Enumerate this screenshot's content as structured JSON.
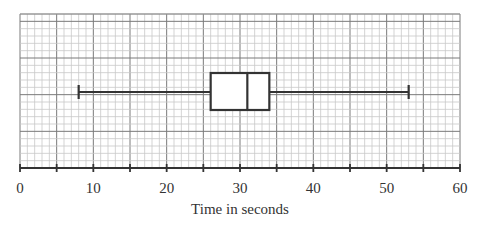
{
  "chart_data": {
    "type": "boxplot",
    "title": "",
    "xlabel": "Time in seconds",
    "ylabel": "",
    "xlim": [
      0,
      60
    ],
    "xticks": [
      0,
      10,
      20,
      30,
      40,
      50,
      60
    ],
    "minor_tick_step": 5,
    "grid": true,
    "grid_minor_step": 1,
    "grid_major_step": 5,
    "box": {
      "min": 8,
      "q1": 26,
      "median": 31,
      "q3": 34,
      "max": 53
    }
  },
  "colors": {
    "grid_minor": "#c8c8c8",
    "grid_major": "#7a7a7a",
    "box_stroke": "#333333",
    "axis": "#333333"
  }
}
